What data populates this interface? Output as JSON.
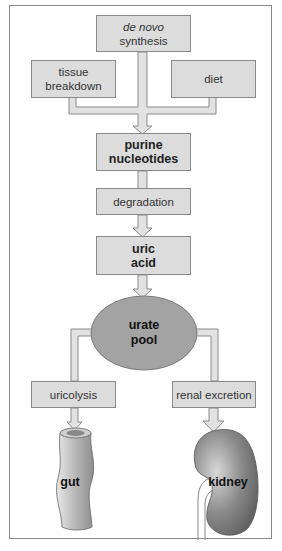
{
  "diagram": {
    "nodes": {
      "de_novo": {
        "line1": "de novo",
        "line2": "synthesis"
      },
      "tissue": {
        "line1": "tissue",
        "line2": "breakdown"
      },
      "diet": {
        "label": "diet"
      },
      "purine": {
        "line1": "purine",
        "line2": "nucleotides"
      },
      "degradation": {
        "label": "degradation"
      },
      "uric_acid": {
        "line1": "uric",
        "line2": "acid"
      },
      "urate_pool": {
        "line1": "urate",
        "line2": "pool"
      },
      "uricolysis": {
        "label": "uricolysis"
      },
      "renal": {
        "label": "renal excretion"
      },
      "gut": {
        "label": "gut"
      },
      "kidney": {
        "label": "kidney"
      }
    },
    "edges": [
      [
        "de novo synthesis",
        "purine nucleotides"
      ],
      [
        "tissue breakdown",
        "purine nucleotides"
      ],
      [
        "diet",
        "purine nucleotides"
      ],
      [
        "purine nucleotides",
        "degradation"
      ],
      [
        "degradation",
        "uric acid"
      ],
      [
        "uric acid",
        "urate pool"
      ],
      [
        "urate pool",
        "uricolysis"
      ],
      [
        "urate pool",
        "renal excretion"
      ],
      [
        "uricolysis",
        "gut"
      ],
      [
        "renal excretion",
        "kidney"
      ]
    ],
    "colors": {
      "box_fill": "#dcdcdc",
      "box_border": "#8a8a8a",
      "pool_fill": "#a3a3a3",
      "connector": "#e2e2e2"
    }
  }
}
